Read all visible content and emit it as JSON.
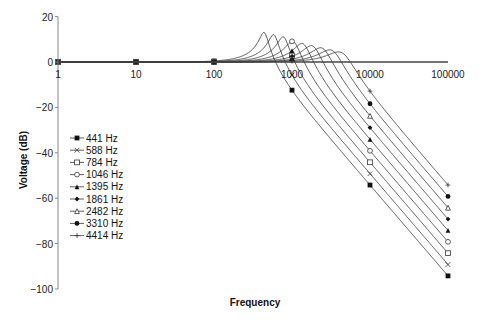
{
  "chart_data": {
    "type": "line",
    "title": "",
    "xlabel": "Frequency",
    "ylabel": "Voltage (dB)",
    "xscale": "log",
    "xlim": [
      1,
      100000
    ],
    "ylim": [
      -100,
      20
    ],
    "x_ticks": [
      "1",
      "10",
      "100",
      "1000",
      "10000",
      "100000"
    ],
    "y_ticks": [
      "20",
      "0",
      "−20",
      "−40",
      "−60",
      "−80",
      "−100"
    ],
    "grid": false,
    "legend_position": "left-inside",
    "x": [
      1,
      10,
      100,
      1000,
      10000,
      100000
    ],
    "series": [
      {
        "name": "441 Hz",
        "marker": "filled-square",
        "cutoff": 441,
        "peak_db": 13,
        "values": [
          0,
          0,
          0,
          -12,
          -54,
          -94
        ]
      },
      {
        "name": "588 Hz",
        "marker": "x",
        "cutoff": 588,
        "peak_db": 12,
        "values": [
          0,
          0,
          0,
          -5,
          -49,
          -89
        ]
      },
      {
        "name": "784 Hz",
        "marker": "open-square",
        "cutoff": 784,
        "peak_db": 11,
        "values": [
          0,
          0,
          0,
          2,
          -44,
          -84
        ]
      },
      {
        "name": "1046 Hz",
        "marker": "open-circle",
        "cutoff": 1046,
        "peak_db": 9,
        "values": [
          0,
          0,
          0,
          9,
          -39,
          -79
        ]
      },
      {
        "name": "1395 Hz",
        "marker": "filled-triangle",
        "cutoff": 1395,
        "peak_db": 8,
        "values": [
          0,
          0,
          0,
          4,
          -34,
          -74
        ]
      },
      {
        "name": "1861 Hz",
        "marker": "filled-diamond",
        "cutoff": 1861,
        "peak_db": 7,
        "values": [
          0,
          0,
          0,
          2,
          -29,
          -69
        ]
      },
      {
        "name": "2482 Hz",
        "marker": "open-triangle",
        "cutoff": 2482,
        "peak_db": 6,
        "values": [
          0,
          0,
          0,
          1,
          -24,
          -64
        ]
      },
      {
        "name": "3310 Hz",
        "marker": "filled-circle",
        "cutoff": 3310,
        "peak_db": 5,
        "values": [
          0,
          0,
          0,
          1,
          0,
          0
        ]
      },
      {
        "name": "4414 Hz",
        "marker": "plus",
        "cutoff": 4414,
        "peak_db": 4,
        "values": [
          0,
          0,
          0,
          0,
          -14,
          -54
        ]
      }
    ]
  }
}
